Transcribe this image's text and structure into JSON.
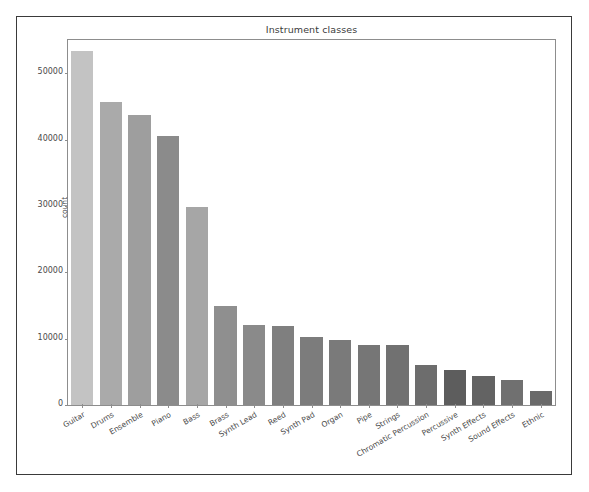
{
  "chart_data": {
    "type": "bar",
    "title": "Instrument classes",
    "xlabel": "",
    "ylabel": "count",
    "ylim": [
      0,
      55000
    ],
    "grid": false,
    "legend": null,
    "categories": [
      "Guitar",
      "Drums",
      "Ensemble",
      "Piano",
      "Bass",
      "Brass",
      "Synth Lead",
      "Reed",
      "Synth Pad",
      "Organ",
      "Pipe",
      "Strings",
      "Chromatic Percussion",
      "Percussive",
      "Synth Effects",
      "Sound Effects",
      "Ethnic"
    ],
    "values": [
      53400,
      45700,
      43700,
      40600,
      29900,
      14900,
      12100,
      11900,
      10300,
      9800,
      9100,
      9000,
      6100,
      5300,
      4400,
      3800,
      2100
    ],
    "yticks": [
      0,
      10000,
      20000,
      30000,
      40000,
      50000
    ],
    "ytick_labels": [
      "0",
      "10000",
      "20000",
      "30000",
      "40000",
      "50000"
    ],
    "bar_colors": [
      "#c3c3c3",
      "#aaaaaa",
      "#9e9e9e",
      "#8b8b8b",
      "#a6a6a6",
      "#8f8f8f",
      "#8a8a8a",
      "#7f7f7f",
      "#7c7c7c",
      "#7a7a7a",
      "#767676",
      "#717171",
      "#6d6d6d",
      "#5d5d5d",
      "#636363",
      "#707070",
      "#6a6a6a"
    ]
  },
  "figure": {
    "title": "Instrument classes",
    "axis_line_color": "#8d8d8d",
    "border_color": "#3a3a3a",
    "tick_label_color": "#4a4a4a"
  }
}
